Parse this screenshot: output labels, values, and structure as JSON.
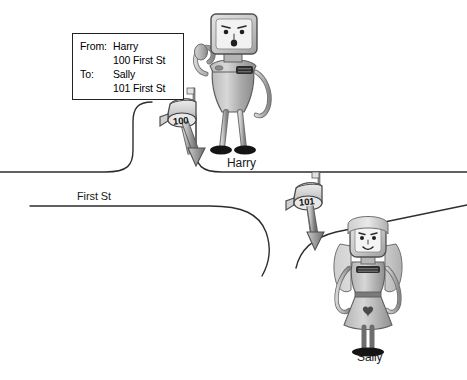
{
  "scene": {
    "title": "Mail delivery between Harry and Sally on First St",
    "background_color": "#ffffff",
    "line_color": "#2a2a2a"
  },
  "envelope": {
    "name": "address-label",
    "rows": [
      {
        "key": "From:",
        "value": "Harry"
      },
      {
        "key": "",
        "value": "100 First St"
      },
      {
        "key": "To:",
        "value": "Sally"
      },
      {
        "key": "",
        "value": "101 First St"
      }
    ]
  },
  "street": {
    "label": "First St"
  },
  "characters": [
    {
      "id": "harry",
      "label": "Harry",
      "role": "sender",
      "description": "robot with monitor-shaped head waving"
    },
    {
      "id": "sally",
      "label": "Sally",
      "role": "recipient",
      "description": "robot with long hair wearing a dress"
    }
  ],
  "mailboxes": [
    {
      "id": "mailbox-100",
      "number": "100",
      "owner": "Harry",
      "flag": "up"
    },
    {
      "id": "mailbox-101",
      "number": "101",
      "owner": "Sally",
      "flag": "up"
    }
  ],
  "icons": {
    "mailbox": "mailbox-icon",
    "arrow_down": "arrow-down-icon",
    "flag": "flag-icon"
  }
}
